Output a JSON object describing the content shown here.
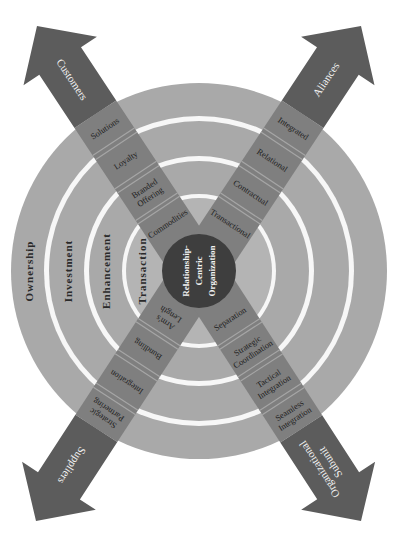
{
  "diagram": {
    "colors": {
      "background": "#ffffff",
      "ring_outer": "#a9a9a9",
      "ring_gap": "#f7f7f7",
      "inner_ring": "#b4b4b4",
      "arrow_shaft": "#7f7f7f",
      "arrow_head": "#5c5c5c",
      "segment_line": "#a6a6a6",
      "center_circle": "#3e3e3e"
    },
    "center": {
      "lines": [
        "Relationship-",
        "Centric",
        "Organization"
      ]
    },
    "rings": [
      {
        "label": "Transaction"
      },
      {
        "label": "Enhancement"
      },
      {
        "label": "Investment"
      },
      {
        "label": "Ownership"
      }
    ],
    "arrows": [
      {
        "id": "customers",
        "label": "Customers",
        "segments": [
          "Commodities",
          "Branded Offering",
          "Loyalty",
          "Solutions"
        ]
      },
      {
        "id": "alliances",
        "label": "Aliances",
        "segments": [
          "Transactional",
          "Contractual",
          "Relational",
          "Integrated"
        ]
      },
      {
        "id": "suppliers",
        "label": "Suppliers",
        "segments": [
          "Arm's Length",
          "Bundling",
          "Integration",
          "Strategic Partnering"
        ]
      },
      {
        "id": "organizational-subunit",
        "label": "Organizational Subunit",
        "segments": [
          "Separation",
          "Strategic Coordination",
          "Tactical Integration",
          "Seamless Integration"
        ]
      }
    ]
  }
}
